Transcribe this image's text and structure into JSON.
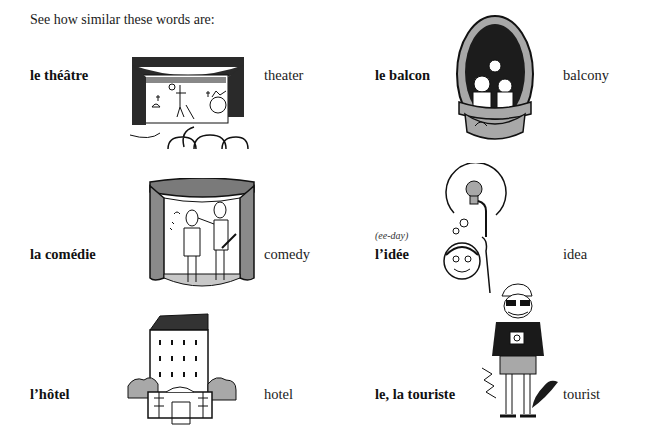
{
  "intro": "See how similar these words are:",
  "vocabulary": [
    {
      "french": "le théâtre",
      "english": "theater",
      "pronunciation": "",
      "picture": "theater-illustration"
    },
    {
      "french": "le balcon",
      "english": "balcony",
      "pronunciation": "",
      "picture": "balcony-illustration"
    },
    {
      "french": "la comédie",
      "english": "comedy",
      "pronunciation": "",
      "picture": "comedy-illustration"
    },
    {
      "french": "l’idée",
      "english": "idea",
      "pronunciation": "(ee-day)",
      "picture": "idea-illustration"
    },
    {
      "french": "l’hôtel",
      "english": "hotel",
      "pronunciation": "",
      "picture": "hotel-illustration"
    },
    {
      "french": "le, la touriste",
      "english": "tourist",
      "pronunciation": "",
      "picture": "tourist-illustration"
    }
  ],
  "colors": {
    "ink": "#111111",
    "gray_fill": "#a8a8a8",
    "curtain": "#2a2a2a",
    "background": "#ffffff"
  }
}
